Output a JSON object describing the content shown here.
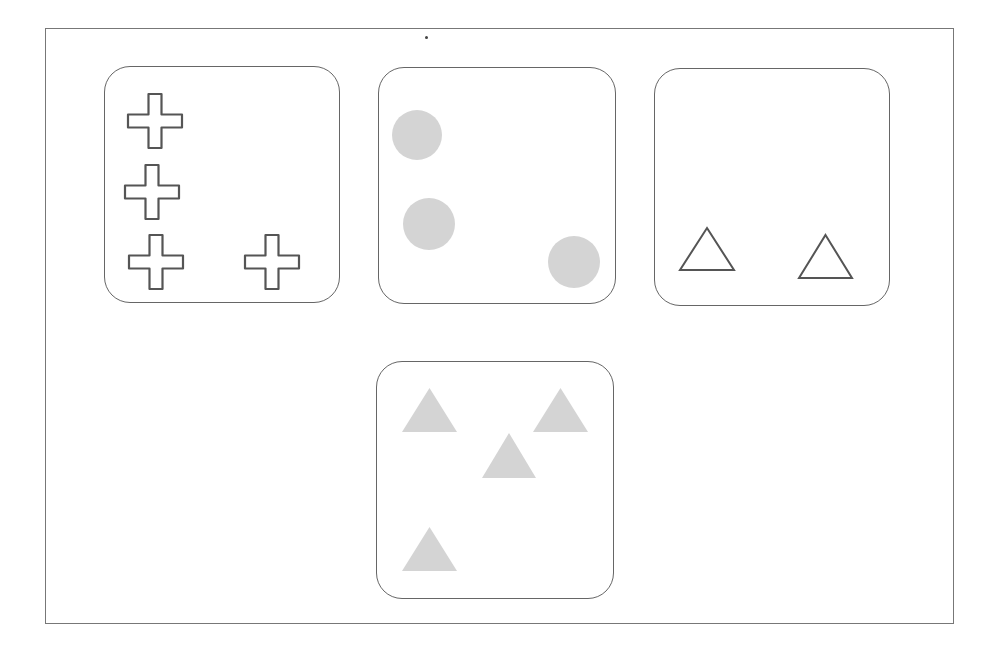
{
  "figure": {
    "frame": {
      "x": 45,
      "y": 28,
      "w": 909,
      "h": 596
    },
    "colors": {
      "outline": "#555555",
      "fill_gray": "#d4d4d4",
      "card_border": "#666666"
    },
    "cards": [
      {
        "name": "crosses-card",
        "x": 104,
        "y": 66,
        "w": 236,
        "h": 237,
        "shape": "outlined-cross",
        "count": 4,
        "items": [
          {
            "cx": 155,
            "cy": 121
          },
          {
            "cx": 152,
            "cy": 192
          },
          {
            "cx": 156,
            "cy": 262
          },
          {
            "cx": 272,
            "cy": 262
          }
        ]
      },
      {
        "name": "circles-card",
        "x": 378,
        "y": 67,
        "w": 238,
        "h": 237,
        "shape": "filled-gray-circle",
        "count": 3,
        "items": [
          {
            "cx": 417,
            "cy": 135,
            "r": 25
          },
          {
            "cx": 429,
            "cy": 224,
            "r": 26
          },
          {
            "cx": 574,
            "cy": 262,
            "r": 26
          }
        ]
      },
      {
        "name": "outlined-triangles-card",
        "x": 654,
        "y": 68,
        "w": 236,
        "h": 238,
        "shape": "outlined-triangle",
        "count": 2,
        "items": [
          {
            "x1": 680,
            "x2": 734,
            "top": 228,
            "bottom": 270
          },
          {
            "x1": 799,
            "x2": 852,
            "top": 235,
            "bottom": 278
          }
        ]
      },
      {
        "name": "filled-triangles-card",
        "x": 376,
        "y": 361,
        "w": 238,
        "h": 238,
        "shape": "filled-gray-triangle",
        "count": 4,
        "items": [
          {
            "x1": 402,
            "x2": 457,
            "top": 388,
            "bottom": 432
          },
          {
            "x1": 533,
            "x2": 588,
            "top": 388,
            "bottom": 432
          },
          {
            "x1": 482,
            "x2": 536,
            "top": 433,
            "bottom": 478
          },
          {
            "x1": 402,
            "x2": 457,
            "top": 527,
            "bottom": 571
          }
        ]
      }
    ]
  }
}
